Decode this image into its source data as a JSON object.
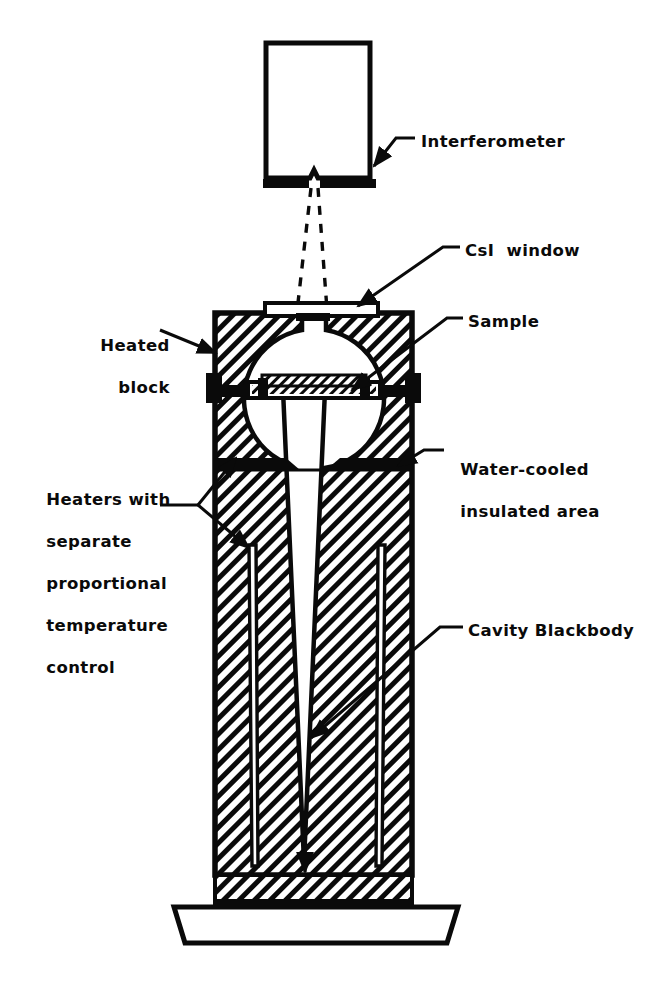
{
  "figure": {
    "type": "technical-cross-section-diagram",
    "background_color": "#ffffff",
    "line_color": "#0a0a0a"
  },
  "labels": {
    "interferometer": "Interferometer",
    "csi_window": "CsI  window",
    "sample": "Sample",
    "heated_block_line1": "Heated",
    "heated_block_line2": "block",
    "water_cooled_line1": "Water-cooled",
    "water_cooled_line2": "insulated area",
    "heaters_line1": "Heaters with",
    "heaters_line2": "separate",
    "heaters_line3": "proportional",
    "heaters_line4": "temperature",
    "heaters_line5": "control",
    "cavity_blackbody": "Cavity Blackbody"
  },
  "parts": {
    "interferometer_box": "interferometer-housing",
    "detector_bars": "interferometer-aperture-bars",
    "beam_lines": "optical-beam-dashed-rays",
    "csi_window_plate": "csi-window-plate",
    "heated_block_body": "heated-block-hatched-body",
    "spherical_chamber": "sample-chamber-cavity",
    "sample_holder": "sample-holder-bar",
    "water_cooled_band": "water-cooled-insulated-band",
    "cavity_taper": "tapered-blackbody-cavity",
    "heater_rods": "heater-rod-channels",
    "base_plate": "base-plate"
  }
}
